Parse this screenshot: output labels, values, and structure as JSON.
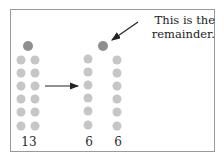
{
  "diagram": {
    "annotation": {
      "line1": "This is the",
      "line2": "remainder."
    },
    "groups": [
      {
        "name": "total",
        "label": "13",
        "count": 13
      },
      {
        "name": "group-a",
        "label": "6",
        "count": 6
      },
      {
        "name": "group-b",
        "label": "6",
        "count": 6
      }
    ],
    "remainder": 1,
    "colors": {
      "dot": "#c6c6c6",
      "dot_highlight": "#8e8e8e",
      "border": "#9a9a9a",
      "text": "#222222"
    }
  }
}
